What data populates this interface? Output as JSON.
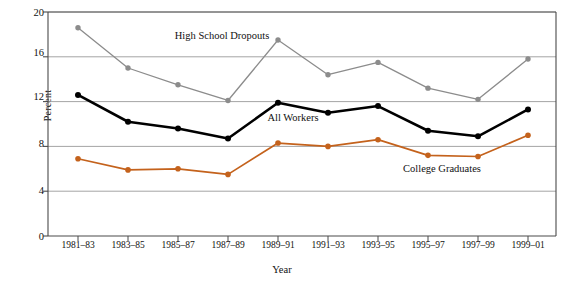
{
  "chart_data": {
    "type": "line",
    "title": "",
    "xlabel": "Year",
    "ylabel": "Percent",
    "ylim": [
      0,
      20
    ],
    "yticks": [
      0,
      4,
      8,
      12,
      16,
      20
    ],
    "grid": "horizontal",
    "legend_position": "inline-annotations",
    "categories": [
      "1981–83",
      "1983–85",
      "1985–87",
      "1987–89",
      "1989–91",
      "1991–93",
      "1993–95",
      "1995–97",
      "1997–99",
      "1999–01"
    ],
    "series": [
      {
        "name": "High School Dropouts",
        "color": "#8c8c8c",
        "marker": "circle",
        "values": [
          18.6,
          15.0,
          13.5,
          12.1,
          17.5,
          14.4,
          15.5,
          13.2,
          12.2,
          15.8
        ]
      },
      {
        "name": "All Workers",
        "color": "#000000",
        "marker": "circle",
        "values": [
          12.6,
          10.2,
          9.6,
          8.7,
          11.9,
          11.0,
          11.6,
          9.4,
          8.9,
          11.3
        ]
      },
      {
        "name": "College Graduates",
        "color": "#c4621c",
        "marker": "circle",
        "values": [
          6.9,
          5.9,
          6.0,
          5.5,
          8.3,
          8.0,
          8.6,
          7.2,
          7.1,
          9.0
        ]
      }
    ],
    "annotations": [
      {
        "text": "High School Dropouts",
        "x_pixel": 222,
        "y_pixel": 36
      },
      {
        "text": "All Workers",
        "x_pixel": 293,
        "y_pixel": 118
      },
      {
        "text": "College Graduates",
        "x_pixel": 442,
        "y_pixel": 169
      }
    ]
  },
  "tick_labels": {
    "y": [
      "0",
      "4",
      "8",
      "12",
      "16",
      "20"
    ],
    "x": [
      "1981–83",
      "1983–85",
      "1985–87",
      "1987–89",
      "1989–91",
      "1991–93",
      "1993–95",
      "1995–97",
      "1997–99",
      "1999–01"
    ]
  },
  "axis_titles": {
    "x": "Year",
    "y": "Percent"
  },
  "colors": {
    "dropouts": "#8c8c8c",
    "all_workers": "#000000",
    "college": "#c4621c",
    "grid": "#9a9a9a",
    "axis": "#4a4a4a",
    "background": "#ffffff"
  }
}
